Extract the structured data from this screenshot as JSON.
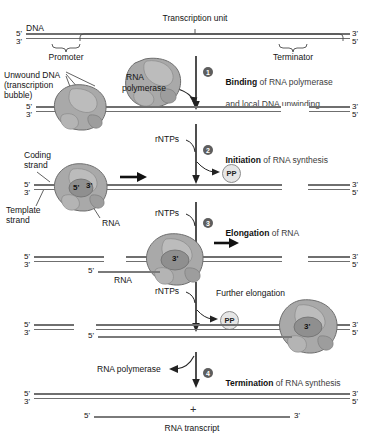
{
  "figure": {
    "title_labels": {
      "dna": "DNA",
      "transcription_unit": "Transcription unit",
      "promoter": "Promoter",
      "terminator": "Terminator",
      "unwound_dna_line1": "Unwound DNA",
      "unwound_dna_line2": "(transcription",
      "unwound_dna_line3": "bubble)",
      "rna_polymerase_1": "RNA",
      "rna_polymerase_2": "polymerase",
      "coding_strand_line1": "Coding",
      "coding_strand_line2": "strand",
      "template_strand_line1": "Template",
      "template_strand_line2": "strand",
      "rna_label_stage2": "RNA",
      "rna_label_stage3": "RNA",
      "rna_polymerase_release": "RNA polymerase",
      "rna_transcript": "RNA transcript",
      "further_elongation": "Further elongation",
      "plus_sign": "+"
    },
    "rntps_labels": [
      "rNTPs",
      "rNTPs",
      "rNTPs"
    ],
    "pp_labels": [
      "PP",
      "PP"
    ],
    "steps": [
      {
        "number": "1",
        "bold": "Binding",
        "rest_line1": " of RNA polymerase",
        "rest_line2": "and local DNA unwinding"
      },
      {
        "number": "2",
        "bold": "Initiation",
        "rest_line1": " of RNA synthesis",
        "rest_line2": ""
      },
      {
        "number": "3",
        "bold": "Elongation",
        "rest_line1": " of RNA",
        "rest_line2": ""
      },
      {
        "number": "4",
        "bold": "Termination",
        "rest_line1": " of RNA synthesis",
        "rest_line2": ""
      }
    ],
    "end_labels": {
      "five_prime": "5'",
      "three_prime": "3'"
    },
    "active_site_labels": {
      "stage2_five": "5'",
      "stage2_three": "3'",
      "stage3_three": "3'",
      "stage4_three": "3'",
      "stage3_rna_five": "5'",
      "stage4_rna_five": "5'"
    },
    "colors": {
      "dna_strand": "#6f6f6f",
      "rna_strand": "#7a7a7a",
      "polymerase_fill": "#a9a9a9",
      "polymerase_edge": "#6d6d6d",
      "step_number_bg": "#5e5e5e",
      "text": "#141414",
      "muted_text": "#3c3c3c",
      "background": "#ffffff"
    }
  }
}
